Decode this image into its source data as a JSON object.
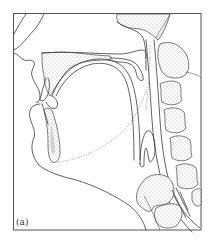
{
  "figure": {
    "label": "(a)",
    "type": "anatomical line drawing",
    "regions": [
      "hard-palate",
      "soft-palate",
      "tongue",
      "mandible",
      "lower-incisor",
      "upper-incisor",
      "pharynx",
      "epiglottis",
      "larynx",
      "cervical-vertebrae"
    ],
    "colors": {
      "line": "#3a3a3a",
      "frame": "#555555",
      "background": "#ffffff"
    }
  }
}
